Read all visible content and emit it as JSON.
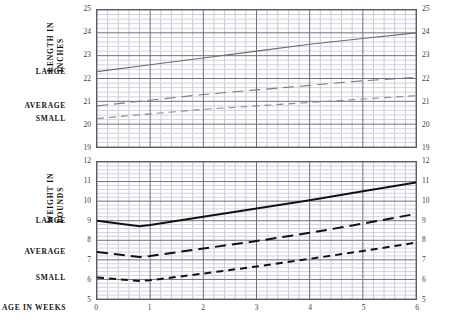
{
  "figure": {
    "x_axis_caption": "AGE IN WEEKS",
    "category_labels": [
      "LARGE",
      "AVERAGE",
      "SMALL"
    ]
  },
  "panels": {
    "length": {
      "title_lines": [
        "LENGTH IN",
        "INCHES"
      ],
      "labels": {
        "large": "LARGE",
        "average": "AVERAGE",
        "small": "SMALL"
      },
      "y_ticks": [
        "25",
        "24",
        "23",
        "22",
        "21",
        "20",
        "19"
      ],
      "x_ticks": [
        "0",
        "1",
        "2",
        "3",
        "4",
        "5",
        "6"
      ]
    },
    "weight": {
      "title_lines": [
        "WEIGHT IN",
        "POUNDS"
      ],
      "labels": {
        "large": "LARGE",
        "average": "AVERAGE",
        "small": "SMALL"
      },
      "y_ticks": [
        "12",
        "11",
        "10",
        "9",
        "8",
        "7",
        "6",
        "5"
      ],
      "x_ticks": [
        "0",
        "1",
        "2",
        "3",
        "4",
        "5",
        "6"
      ]
    }
  },
  "chart_data": [
    {
      "type": "line",
      "id": "length-chart",
      "title": "LENGTH IN INCHES",
      "xlabel": "AGE IN WEEKS",
      "ylabel": "LENGTH IN INCHES",
      "xlim": [
        0,
        6
      ],
      "ylim": [
        19,
        25
      ],
      "xticks": [
        0,
        1,
        2,
        3,
        4,
        5,
        6
      ],
      "yticks": [
        19,
        20,
        21,
        22,
        23,
        24,
        25
      ],
      "grid": true,
      "minor_grid": true,
      "minor_x_divisions": 5,
      "minor_y_divisions": 5,
      "legend": "margin-labels-left",
      "x": [
        0,
        1,
        2,
        3,
        4,
        5,
        6
      ],
      "series": [
        {
          "name": "LARGE",
          "style": "solid",
          "color": "#6b6b6b",
          "values": [
            22.3,
            22.6,
            22.9,
            23.2,
            23.5,
            23.75,
            24.0
          ]
        },
        {
          "name": "AVERAGE",
          "style": "dashed",
          "color": "#7a7a7a",
          "values": [
            20.8,
            21.05,
            21.3,
            21.5,
            21.7,
            21.9,
            22.05
          ]
        },
        {
          "name": "SMALL",
          "style": "fine-dashed",
          "color": "#8a8a8a",
          "values": [
            20.25,
            20.45,
            20.65,
            20.8,
            20.95,
            21.1,
            21.25
          ]
        }
      ]
    },
    {
      "type": "line",
      "id": "weight-chart",
      "title": "WEIGHT IN POUNDS",
      "xlabel": "AGE IN WEEKS",
      "ylabel": "WEIGHT IN POUNDS",
      "xlim": [
        0,
        6
      ],
      "ylim": [
        5,
        12
      ],
      "xticks": [
        0,
        1,
        2,
        3,
        4,
        5,
        6
      ],
      "yticks": [
        5,
        6,
        7,
        8,
        9,
        10,
        11,
        12
      ],
      "grid": true,
      "minor_grid": true,
      "minor_x_divisions": 5,
      "minor_y_divisions": 5,
      "legend": "margin-labels-left",
      "x": [
        0,
        0.8,
        1,
        2,
        3,
        4,
        5,
        6
      ],
      "series": [
        {
          "name": "LARGE",
          "style": "solid",
          "color": "#111111",
          "values": [
            9.0,
            8.72,
            8.78,
            9.2,
            9.62,
            10.05,
            10.5,
            10.95
          ]
        },
        {
          "name": "AVERAGE",
          "style": "dashed",
          "color": "#111111",
          "values": [
            7.4,
            7.15,
            7.2,
            7.58,
            7.96,
            8.38,
            8.85,
            9.35
          ]
        },
        {
          "name": "SMALL",
          "style": "fine-dashed",
          "color": "#111111",
          "values": [
            6.1,
            5.92,
            5.96,
            6.3,
            6.66,
            7.05,
            7.45,
            7.88
          ]
        }
      ]
    }
  ]
}
